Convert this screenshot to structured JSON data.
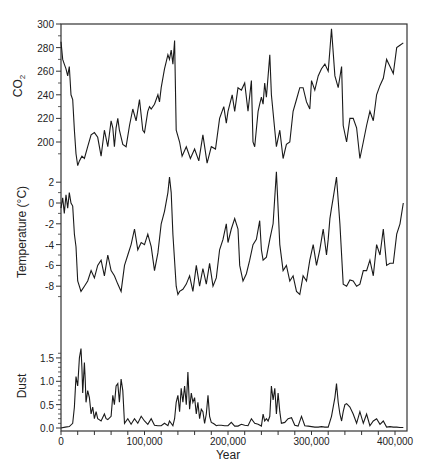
{
  "figure": {
    "xlabel": "Year",
    "x_ticks": [
      {
        "value": 0,
        "label": "0"
      },
      {
        "value": 100000,
        "label": "100,000"
      },
      {
        "value": 200000,
        "label": "200,000"
      },
      {
        "value": 300000,
        "label": "300,000"
      },
      {
        "value": 400000,
        "label": "400,000"
      }
    ],
    "colors": {
      "line": "#1a1a1a",
      "frame": "#333333",
      "background": "#ffffff"
    }
  },
  "chart_data": [
    {
      "type": "line",
      "title": "",
      "xlabel": "Year",
      "ylabel": "CO2",
      "ylabel_main": "CO",
      "ylabel_sub": "2",
      "ylim": [
        175,
        300
      ],
      "xlim": [
        0,
        414000
      ],
      "yticks": [
        200,
        220,
        240,
        260,
        280,
        300
      ],
      "grid": false,
      "x": [
        0,
        2000,
        4000,
        6000,
        8000,
        10000,
        12000,
        14000,
        16000,
        18000,
        20000,
        22000,
        25000,
        28000,
        32000,
        36000,
        40000,
        44000,
        48000,
        52000,
        56000,
        60000,
        62000,
        64000,
        66000,
        68000,
        70000,
        74000,
        78000,
        82000,
        86000,
        90000,
        94000,
        98000,
        100000,
        104000,
        106000,
        108000,
        112000,
        116000,
        118000,
        120000,
        124000,
        126000,
        128000,
        130000,
        132000,
        134000,
        136000,
        138000,
        142000,
        145000,
        150000,
        155000,
        160000,
        165000,
        170000,
        175000,
        180000,
        185000,
        190000,
        195000,
        198000,
        200000,
        205000,
        208000,
        212000,
        216000,
        220000,
        224000,
        228000,
        230000,
        232000,
        236000,
        238000,
        240000,
        242000,
        244000,
        246000,
        250000,
        252000,
        256000,
        258000,
        262000,
        266000,
        270000,
        274000,
        278000,
        282000,
        286000,
        290000,
        294000,
        298000,
        300000,
        304000,
        308000,
        312000,
        316000,
        320000,
        322000,
        324000,
        328000,
        332000,
        336000,
        338000,
        342000,
        346000,
        350000,
        354000,
        358000,
        362000,
        366000,
        370000,
        374000,
        378000,
        382000,
        386000,
        390000,
        394000,
        398000,
        402000,
        406000,
        410000
      ],
      "values": [
        285,
        270,
        266,
        262,
        256,
        264,
        240,
        236,
        210,
        190,
        180,
        184,
        188,
        186,
        196,
        206,
        208,
        204,
        188,
        210,
        196,
        218,
        212,
        196,
        212,
        220,
        210,
        198,
        196,
        214,
        228,
        218,
        236,
        210,
        208,
        226,
        230,
        228,
        232,
        240,
        234,
        246,
        262,
        268,
        274,
        270,
        278,
        266,
        286,
        210,
        200,
        188,
        196,
        186,
        194,
        184,
        206,
        182,
        196,
        194,
        220,
        230,
        216,
        226,
        240,
        226,
        246,
        244,
        250,
        226,
        252,
        200,
        196,
        226,
        232,
        238,
        232,
        250,
        238,
        274,
        240,
        210,
        196,
        210,
        186,
        198,
        200,
        226,
        236,
        246,
        246,
        234,
        228,
        252,
        244,
        256,
        262,
        266,
        260,
        278,
        296,
        256,
        246,
        264,
        214,
        200,
        220,
        220,
        212,
        186,
        200,
        214,
        226,
        218,
        240,
        248,
        254,
        270,
        264,
        258,
        280,
        282,
        284
      ]
    },
    {
      "type": "line",
      "title": "",
      "xlabel": "Year",
      "ylabel": "Temperature (°C)",
      "ylim": [
        -10,
        3
      ],
      "xlim": [
        0,
        414000
      ],
      "yticks": [
        2,
        0,
        -2,
        -4,
        -6,
        -8
      ],
      "grid": false,
      "x": [
        0,
        2000,
        4000,
        6000,
        8000,
        10000,
        12000,
        14000,
        16000,
        18000,
        20000,
        24000,
        28000,
        32000,
        36000,
        40000,
        44000,
        48000,
        52000,
        56000,
        60000,
        64000,
        68000,
        72000,
        76000,
        80000,
        84000,
        88000,
        92000,
        96000,
        100000,
        104000,
        108000,
        112000,
        116000,
        120000,
        124000,
        128000,
        130000,
        132000,
        134000,
        138000,
        140000,
        142000,
        146000,
        150000,
        154000,
        158000,
        162000,
        166000,
        170000,
        174000,
        178000,
        182000,
        186000,
        190000,
        194000,
        198000,
        200000,
        204000,
        208000,
        212000,
        214000,
        218000,
        222000,
        226000,
        230000,
        234000,
        238000,
        240000,
        242000,
        246000,
        250000,
        254000,
        258000,
        262000,
        266000,
        270000,
        274000,
        278000,
        282000,
        286000,
        290000,
        294000,
        298000,
        302000,
        306000,
        310000,
        314000,
        318000,
        320000,
        322000,
        324000,
        326000,
        330000,
        334000,
        338000,
        342000,
        346000,
        350000,
        354000,
        358000,
        362000,
        366000,
        370000,
        374000,
        378000,
        382000,
        386000,
        390000,
        394000,
        398000,
        402000,
        406000,
        410000
      ],
      "values": [
        -0.5,
        0.5,
        -1,
        0.8,
        -0.5,
        1,
        0,
        -0.3,
        -3,
        -4.2,
        -7.5,
        -8.5,
        -8,
        -7.5,
        -6.5,
        -7.2,
        -6,
        -5.5,
        -7,
        -5,
        -6.5,
        -7,
        -7.8,
        -8.5,
        -6,
        -5,
        -4,
        -2.5,
        -4.5,
        -3.8,
        -4,
        -3,
        -4.2,
        -6.5,
        -4.8,
        -2,
        -0.8,
        1,
        2.5,
        1,
        -3,
        -8,
        -8.8,
        -8.5,
        -8.3,
        -7.8,
        -7,
        -8.5,
        -6,
        -8,
        -6.3,
        -7.8,
        -5.8,
        -8,
        -7.2,
        -4.5,
        -3.5,
        -2,
        -3.8,
        -2.5,
        -1.5,
        -2.5,
        -6,
        -7.5,
        -6.8,
        -5.5,
        -4,
        -3.5,
        -1.7,
        -4.5,
        -5.5,
        -5.2,
        -3.5,
        -2,
        3,
        -4,
        -6.5,
        -6,
        -7.5,
        -7,
        -8.5,
        -8.8,
        -7,
        -7.5,
        -5.5,
        -4,
        -6,
        -4.5,
        -2.5,
        -5,
        -3.5,
        -1.5,
        -0.5,
        0.5,
        2.5,
        -2,
        -7.8,
        -8,
        -7.4,
        -7.5,
        -8,
        -7.8,
        -6.5,
        -6.5,
        -5.5,
        -7,
        -4,
        -5,
        -2.5,
        -6,
        -5.8,
        -5.8,
        -3,
        -2,
        0,
        1.5,
        0.8
      ]
    },
    {
      "type": "line",
      "title": "",
      "xlabel": "Year",
      "ylabel": "Dust",
      "ylim": [
        0,
        1.7
      ],
      "xlim": [
        0,
        414000
      ],
      "yticks": [
        0.0,
        0.5,
        1.0,
        1.5
      ],
      "grid": false,
      "x": [
        0,
        5000,
        10000,
        14000,
        16000,
        18000,
        20000,
        22000,
        24000,
        25000,
        26000,
        28000,
        29000,
        30000,
        32000,
        34000,
        36000,
        38000,
        40000,
        42000,
        44000,
        48000,
        52000,
        54000,
        56000,
        60000,
        62000,
        64000,
        66000,
        68000,
        70000,
        72000,
        74000,
        76000,
        80000,
        84000,
        88000,
        92000,
        96000,
        100000,
        104000,
        108000,
        112000,
        116000,
        120000,
        124000,
        128000,
        130000,
        134000,
        136000,
        138000,
        140000,
        142000,
        144000,
        146000,
        148000,
        150000,
        152000,
        154000,
        156000,
        158000,
        160000,
        162000,
        164000,
        166000,
        168000,
        170000,
        172000,
        174000,
        176000,
        178000,
        180000,
        182000,
        184000,
        186000,
        188000,
        192000,
        196000,
        200000,
        204000,
        208000,
        212000,
        216000,
        220000,
        224000,
        228000,
        232000,
        236000,
        240000,
        242000,
        244000,
        246000,
        248000,
        250000,
        252000,
        254000,
        256000,
        258000,
        260000,
        262000,
        264000,
        268000,
        272000,
        276000,
        280000,
        284000,
        288000,
        292000,
        296000,
        300000,
        304000,
        308000,
        312000,
        316000,
        320000,
        324000,
        328000,
        330000,
        332000,
        334000,
        336000,
        338000,
        340000,
        342000,
        346000,
        350000,
        354000,
        358000,
        362000,
        366000,
        370000,
        374000,
        378000,
        382000,
        386000,
        390000,
        394000,
        398000,
        402000,
        406000,
        410000
      ],
      "values": [
        0,
        0.02,
        0.03,
        0.1,
        0.45,
        1.1,
        0.9,
        1.5,
        1.7,
        1.3,
        0.75,
        1.4,
        1.05,
        0.55,
        0.8,
        0.65,
        0.3,
        0.45,
        0.2,
        0.35,
        0.2,
        0.15,
        0.3,
        0.2,
        0.18,
        0.25,
        0.7,
        0.5,
        0.9,
        0.95,
        0.55,
        1.05,
        0.8,
        0.1,
        0.2,
        0.08,
        0.2,
        0.1,
        0.25,
        0.15,
        0.08,
        0.2,
        0.06,
        0.05,
        0.05,
        0.1,
        0.05,
        0.15,
        0.05,
        0.2,
        0.55,
        0.7,
        0.35,
        0.85,
        0.55,
        0.9,
        0.5,
        1.2,
        0.4,
        0.75,
        0.55,
        0.65,
        0.3,
        0.55,
        0.2,
        0.4,
        0.35,
        0.1,
        0.3,
        0.7,
        0.25,
        0.12,
        0.1,
        0.08,
        0.05,
        0.06,
        0.06,
        0.05,
        0.05,
        0.12,
        0.04,
        0.04,
        0.08,
        0.06,
        0.05,
        0.2,
        0.1,
        0.08,
        0.04,
        0.3,
        0.15,
        0.2,
        0.15,
        0.25,
        0.9,
        0.6,
        0.85,
        0.3,
        0.75,
        0.35,
        0.1,
        0.12,
        0.2,
        0.22,
        0.06,
        0.04,
        0.25,
        0.05,
        0.04,
        0.03,
        0.02,
        0.02,
        0.03,
        0.02,
        0.02,
        0.25,
        0.65,
        0.95,
        0.55,
        0.3,
        0.15,
        0.35,
        0.5,
        0.52,
        0.45,
        0.3,
        0.1,
        0.35,
        0.1,
        0.3,
        0.05,
        0.15,
        0.2,
        0.08,
        0.15,
        0.02,
        0.03,
        0.02,
        0.02,
        0.01,
        0.01
      ]
    }
  ]
}
